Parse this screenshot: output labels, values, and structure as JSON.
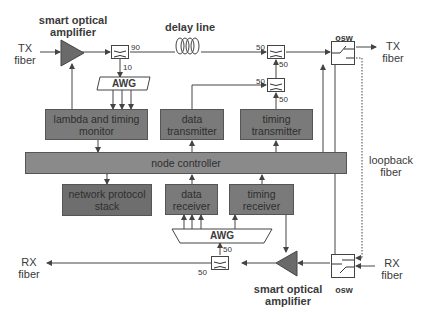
{
  "diagram": {
    "labels": {
      "tx_fiber_in": "TX\nfiber",
      "tx_fiber_in_line1": "TX",
      "tx_fiber_in_line2": "fiber",
      "tx_fiber_out_line1": "TX",
      "tx_fiber_out_line2": "fiber",
      "rx_fiber_in_line1": "RX",
      "rx_fiber_in_line2": "fiber",
      "rx_fiber_out_line1": "RX",
      "rx_fiber_out_line2": "fiber",
      "smart_amp_top_line1": "smart optical",
      "smart_amp_top_line2": "amplifier",
      "smart_amp_bottom_line1": "smart optical",
      "smart_amp_bottom_line2": "amplifier",
      "delay_line": "delay line",
      "osw_top": "osw",
      "osw_bottom": "osw",
      "loopback_line1": "loopback",
      "loopback_line2": "fiber"
    },
    "couplers": {
      "tap_top": {
        "out_right": "90",
        "out_down": "10"
      },
      "combiner_upper": {
        "in_left": "50",
        "out_down": "50"
      },
      "combiner_lower": {
        "in_left": "50",
        "in_bottom": "50"
      },
      "splitter_bottom": {
        "out_up": "50",
        "out_left": "50"
      }
    },
    "awg": {
      "top": "AWG",
      "bottom": "AWG"
    },
    "blocks": {
      "lambda_monitor_line1": "lambda and timing",
      "lambda_monitor_line2": "monitor",
      "data_transmitter_line1": "data",
      "data_transmitter_line2": "transmitter",
      "timing_transmitter_line1": "timing",
      "timing_transmitter_line2": "transmitter",
      "node_controller": "node controller",
      "network_protocol_line1": "network protocol",
      "network_protocol_line2": "stack",
      "data_receiver_line1": "data",
      "data_receiver_line2": "receiver",
      "timing_receiver_line1": "timing",
      "timing_receiver_line2": "receiver"
    },
    "colors": {
      "block_fill": "#7a7a7a",
      "amplifier_fill": "#6a6a6a",
      "line": "#444444",
      "background": "#ffffff"
    }
  }
}
